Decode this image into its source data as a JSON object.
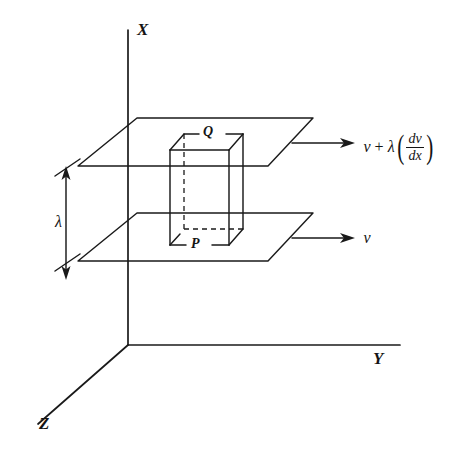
{
  "figure": {
    "ink_color": "#1a1a1a",
    "background_color": "#ffffff"
  },
  "axes": {
    "x": {
      "label": "X",
      "direction": "vertical-up"
    },
    "y": {
      "label": "Y",
      "direction": "horizontal-right"
    },
    "z": {
      "label": "Z",
      "direction": "diagonal-down-left"
    },
    "origin_label": ""
  },
  "planes": {
    "upper": {
      "name": "upper-plane"
    },
    "lower": {
      "name": "lower-plane"
    }
  },
  "prism": {
    "top_face_label": "Q",
    "bottom_face_label": "P"
  },
  "separation": {
    "symbol": "λ",
    "description": "mean free path between the two layers"
  },
  "velocity_upper": {
    "base": "v",
    "operator": "+",
    "coefficient": "λ",
    "numerator": "dv",
    "denominator": "dx",
    "full_text": "v + λ(dv/dx)"
  },
  "velocity_lower": {
    "base": "v",
    "full_text": "v"
  }
}
